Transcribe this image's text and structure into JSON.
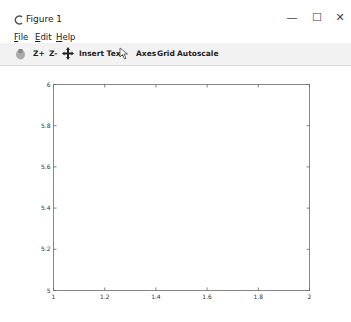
{
  "window": {
    "title": "Figure 1",
    "minimize_label": "—",
    "maximize_label": "☐",
    "close_label": "✕"
  },
  "menu": {
    "items": [
      {
        "label": "File",
        "accel": "F"
      },
      {
        "label": "Edit",
        "accel": "E"
      },
      {
        "label": "Help",
        "accel": "H"
      }
    ]
  },
  "toolbar": {
    "items": [
      {
        "label": "",
        "icon": "save-icon"
      },
      {
        "label": "Z+"
      },
      {
        "label": "Z-"
      },
      {
        "label": "",
        "icon": "move-icon"
      },
      {
        "label": "Insert Text"
      },
      {
        "label": "",
        "icon": "cursor-icon"
      },
      {
        "label": "Axes"
      },
      {
        "label": "Grid"
      },
      {
        "label": "Autoscale"
      }
    ]
  },
  "chart_data": {
    "type": "line",
    "series": [],
    "xlim": [
      1,
      2
    ],
    "ylim": [
      5,
      6
    ],
    "xticks": [
      "1",
      "1.2",
      "1.4",
      "1.6",
      "1.8",
      "2"
    ],
    "yticks": [
      "5",
      "5.2",
      "5.4",
      "5.6",
      "5.8",
      "6"
    ],
    "xtick_values": [
      1,
      1.2,
      1.4,
      1.6,
      1.8,
      2
    ],
    "ytick_values": [
      5,
      5.2,
      5.4,
      5.6,
      5.8,
      6
    ],
    "title": "",
    "xlabel": "",
    "ylabel": "",
    "grid": false
  }
}
